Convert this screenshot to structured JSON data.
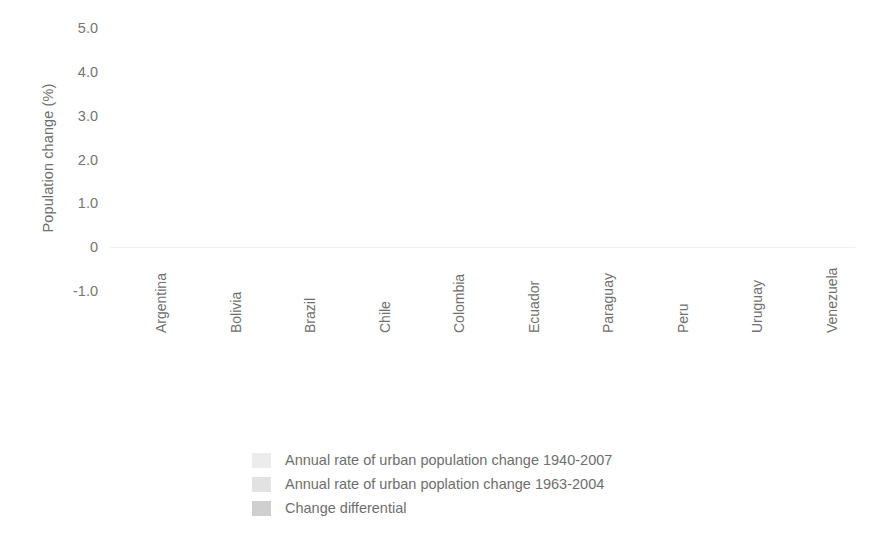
{
  "chart_data": {
    "type": "bar",
    "title": "",
    "xlabel": "",
    "ylabel": "Population change (%)",
    "ylim": [
      -1.5,
      5.0
    ],
    "yticks": [
      "5.0",
      "4.0",
      "3.0",
      "2.0",
      "1.0",
      "0",
      "-1.0"
    ],
    "ytick_values": [
      5.0,
      4.0,
      3.0,
      2.0,
      1.0,
      0,
      -1.0
    ],
    "grid": false,
    "legend_position": "bottom-center",
    "categories": [
      "Argentina",
      "Bolivia",
      "Brazil",
      "Chile",
      "Colombia",
      "Ecuador",
      "Paraguay",
      "Peru",
      "Uruguay",
      "Venezuela"
    ],
    "series": [
      {
        "name": "Annual rate of urban population change 1940-2007",
        "color": "#ececed",
        "values": [
          2.15,
          3.2,
          3.95,
          2.55,
          3.25,
          4.1,
          3.5,
          3.35,
          0.82,
          4.3
        ]
      },
      {
        "name": "Annual rate of urban poplation change 1963-2004",
        "color": "#e2e2e3",
        "values": [
          -1.05,
          0.85,
          -0.15,
          -0.35,
          0.6,
          1.4,
          1.75,
          0.6,
          -1.4,
          -0.2
        ]
      },
      {
        "name": "Change differential",
        "color": "#cfcfd0",
        "values": [
          3.2,
          2.25,
          3.95,
          2.85,
          2.65,
          2.65,
          1.7,
          2.5,
          2.4,
          4.45
        ]
      }
    ]
  },
  "legend": {
    "items": [
      {
        "label": "Annual rate of urban population change 1940-2007",
        "swatch": "series-0-swatch"
      },
      {
        "label": "Annual rate of urban poplation change 1963-2004",
        "swatch": "series-1-swatch"
      },
      {
        "label": "Change differential",
        "swatch": "series-2-swatch"
      }
    ]
  },
  "axis": {
    "y_title": "Population change (%)"
  },
  "colors": {
    "series_0": "#ececed",
    "series_1": "#e2e2e3",
    "series_2": "#cfcfd0",
    "text": "#6f6f6f",
    "background": "#ffffff"
  }
}
